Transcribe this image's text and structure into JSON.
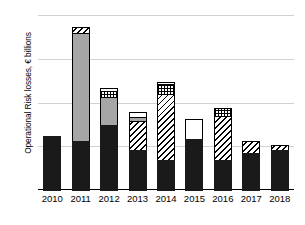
{
  "chart_data": {
    "type": "bar",
    "title": "",
    "xlabel": "",
    "ylabel": "Operational Risk losses, € billions",
    "ylim": [
      0,
      60
    ],
    "yticks": [
      "0",
      "15",
      "30",
      "45",
      "60"
    ],
    "grid": true,
    "legend": "none",
    "stacked": true,
    "categories": [
      "2010",
      "2011",
      "2012",
      "2013",
      "2014",
      "2015",
      "2016",
      "2017",
      "2018"
    ],
    "series": [
      {
        "name": "segment-1-black",
        "pattern": "solid-black",
        "values": [
          19.0,
          17.0,
          22.5,
          14.0,
          10.5,
          18.0,
          10.5,
          13.0,
          14.0
        ]
      },
      {
        "name": "segment-2-hatch",
        "pattern": "diagonal-hatch",
        "values": [
          0,
          0,
          0,
          10.5,
          23.0,
          0,
          15.5,
          4.5,
          2.0
        ]
      },
      {
        "name": "segment-3-gray",
        "pattern": "solid-gray",
        "values": [
          0,
          37.5,
          10.0,
          1.5,
          0,
          0,
          0,
          0,
          0
        ]
      },
      {
        "name": "segment-4-checker",
        "pattern": "checker",
        "values": [
          0,
          0,
          2.5,
          0,
          4.0,
          0,
          3.0,
          0,
          0
        ]
      },
      {
        "name": "segment-5-white",
        "pattern": "solid-white",
        "values": [
          0,
          0,
          1.5,
          2.0,
          1.0,
          7.0,
          0,
          0,
          0
        ]
      },
      {
        "name": "segment-6-hatch-top",
        "pattern": "diagonal-hatch",
        "values": [
          0,
          2.5,
          0,
          0,
          0,
          0,
          0,
          0,
          0
        ]
      }
    ],
    "totals": [
      19.0,
      57.0,
      36.5,
      28.0,
      38.5,
      25.0,
      29.0,
      17.5,
      16.0
    ]
  },
  "axes": {
    "y_title": "Operational Risk losses, € billions",
    "y_ticks": [
      {
        "label": "60",
        "value": 60
      },
      {
        "label": "45",
        "value": 45
      },
      {
        "label": "30",
        "value": 30
      },
      {
        "label": "15",
        "value": 15
      },
      {
        "label": "0",
        "value": 0
      }
    ],
    "x_ticks": [
      {
        "label": "2010"
      },
      {
        "label": "2011"
      },
      {
        "label": "2012"
      },
      {
        "label": "2013"
      },
      {
        "label": "2014"
      },
      {
        "label": "2015"
      },
      {
        "label": "2016"
      },
      {
        "label": "2017"
      },
      {
        "label": "2018"
      }
    ]
  },
  "style": {
    "gridline_color": "#d2d2d2",
    "axis_color": "#000000",
    "black_fill": "#1a1a1a",
    "gray_fill": "#a6a6a6",
    "white_fill": "#ffffff",
    "background": "#ffffff"
  }
}
